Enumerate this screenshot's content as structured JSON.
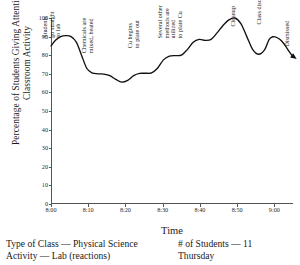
{
  "chart_data": {
    "type": "line",
    "title": "",
    "xlabel": "Time",
    "ylabel": "Percentage of Students Giving Attention to Classroom Activity",
    "xlim": [
      0,
      65
    ],
    "ylim": [
      0,
      100
    ],
    "grid": false,
    "legend_position": "none",
    "xtick_labels": [
      "8:00",
      "8:10",
      "8:20",
      "8:30",
      "8:40",
      "8:50",
      "9:00"
    ],
    "xtick_values": [
      0,
      10,
      20,
      30,
      40,
      50,
      60
    ],
    "ytick_labels": [
      "0",
      "10",
      "20",
      "30",
      "40",
      "50",
      "60",
      "70",
      "80",
      "90",
      "100"
    ],
    "ytick_values": [
      0,
      10,
      20,
      30,
      40,
      50,
      60,
      70,
      80,
      90,
      100
    ],
    "series": [
      {
        "name": "Attention",
        "line_color": "#111111",
        "x": [
          0.0,
          1.2,
          2.6,
          4.0,
          5.4,
          6.8,
          8.2,
          9.6,
          11.0,
          12.6,
          14.2,
          15.8,
          17.4,
          19.0,
          20.6,
          22.2,
          23.8,
          25.4,
          27.0,
          28.6,
          30.2,
          31.8,
          33.4,
          35.0,
          36.6,
          38.2,
          39.8,
          41.4,
          43.0,
          44.6,
          46.2,
          47.8,
          49.4,
          51.0,
          52.6,
          54.2,
          55.8,
          57.4,
          58.6,
          59.6
        ],
        "y": [
          85.0,
          88.0,
          90.0,
          90.5,
          90.0,
          87.0,
          80.0,
          73.0,
          70.5,
          70.0,
          69.8,
          69.0,
          67.0,
          65.5,
          66.5,
          69.0,
          70.2,
          70.3,
          70.5,
          73.0,
          77.5,
          79.5,
          79.8,
          80.0,
          83.0,
          87.0,
          88.5,
          88.0,
          88.5,
          92.0,
          96.0,
          99.0,
          100.0,
          97.0,
          90.0,
          83.0,
          80.5,
          83.0,
          88.5,
          90.0
        ]
      }
    ],
    "annotations": [
      {
        "text": "Students\ngo straight\nto lab",
        "x": 3.0,
        "y": 100
      },
      {
        "text": "Chemicals are\nmixed, heated",
        "x": 11.5,
        "y": 88
      },
      {
        "text": "Cu begins\nto plate out",
        "x": 24.0,
        "y": 91
      },
      {
        "text": "Several other\nmethods are\nutilized\nto plate Cu",
        "x": 35.5,
        "y": 103
      },
      {
        "text": "Cleanup",
        "x": 50.0,
        "y": 99
      },
      {
        "text": "Class discussion",
        "x": 57.0,
        "y": 100
      },
      {
        "text": "Dismissed",
        "x": 64.5,
        "y": 88
      }
    ],
    "end_arrow": {
      "from_x": 59.6,
      "from_y": 90.0,
      "to_x": 66.0,
      "to_y": 78.0
    }
  },
  "axis_titles": {
    "x": "Time",
    "y": "Percentage of Students Giving Attention to Classroom Activity"
  },
  "caption": {
    "left": [
      "Type of Class — Physical Science",
      "Activity — Lab (reactions)"
    ],
    "right": [
      "# of Students — 11",
      "Thursday"
    ]
  }
}
